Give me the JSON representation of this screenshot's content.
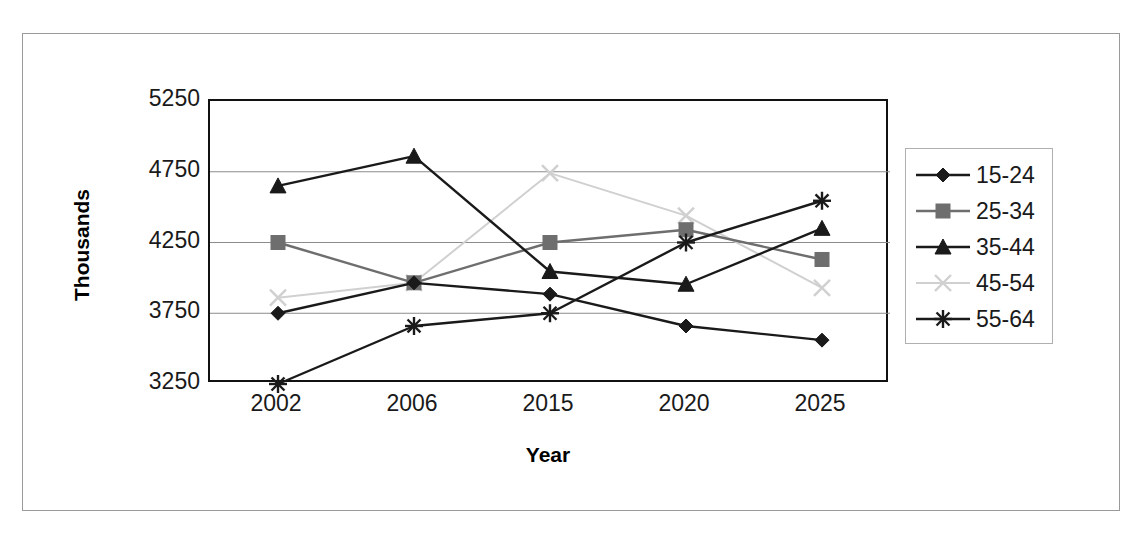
{
  "chart_data": {
    "type": "line",
    "title": "",
    "xlabel": "Year",
    "ylabel": "Thousands",
    "categories": [
      "2002",
      "2006",
      "2015",
      "2020",
      "2025"
    ],
    "x": [
      2002,
      2006,
      2015,
      2020,
      2025
    ],
    "ylim": [
      3250,
      5250
    ],
    "yticks": [
      3250,
      3750,
      4250,
      4750,
      5250
    ],
    "grid": true,
    "legend_position": "right",
    "series": [
      {
        "name": "15-24",
        "marker": "diamond",
        "color": "#1a1a1a",
        "values": [
          3750,
          3965,
          3885,
          3660,
          3560
        ]
      },
      {
        "name": "25-34",
        "marker": "square",
        "color": "#6e6e6e",
        "values": [
          4250,
          3965,
          4250,
          4340,
          4130
        ]
      },
      {
        "name": "35-44",
        "marker": "triangle",
        "color": "#1a1a1a",
        "values": [
          4650,
          4860,
          4045,
          3955,
          4350
        ]
      },
      {
        "name": "45-54",
        "marker": "cross-x",
        "color": "#d0d0d0",
        "values": [
          3860,
          3965,
          4740,
          4440,
          3930
        ]
      },
      {
        "name": "55-64",
        "marker": "asterisk",
        "color": "#1a1a1a",
        "values": [
          3250,
          3660,
          3750,
          4250,
          4545
        ]
      }
    ]
  },
  "axis": {
    "y_title": "Thousands",
    "x_title": "Year",
    "y_tick_labels": [
      "5250",
      "4750",
      "4250",
      "3750",
      "3250"
    ],
    "x_tick_labels": [
      "2002",
      "2006",
      "2015",
      "2020",
      "2025"
    ]
  },
  "legend": {
    "entries": [
      {
        "label": "15-24"
      },
      {
        "label": "25-34"
      },
      {
        "label": "35-44"
      },
      {
        "label": "45-54"
      },
      {
        "label": "55-64"
      }
    ]
  },
  "colors": {
    "plot_border": "#111111",
    "gridline": "#8c8c8c",
    "page_frame": "#9a9a9a",
    "legend_border": "#b0b0b0"
  }
}
